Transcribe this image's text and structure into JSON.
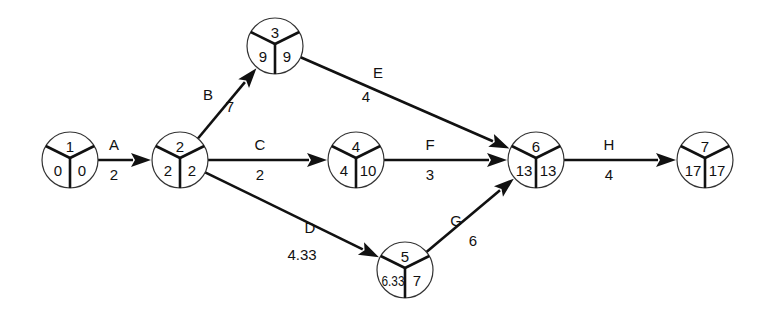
{
  "diagram": {
    "type": "activity-on-arrow network (PERT/CPM)",
    "node_radius": 28,
    "nodes": [
      {
        "id": "1",
        "x": 70,
        "y": 160,
        "label": "1",
        "earliest": "0",
        "latest": "0"
      },
      {
        "id": "2",
        "x": 180,
        "y": 160,
        "label": "2",
        "earliest": "2",
        "latest": "2"
      },
      {
        "id": "3",
        "x": 275,
        "y": 46,
        "label": "3",
        "earliest": "9",
        "latest": "9"
      },
      {
        "id": "4",
        "x": 356,
        "y": 160,
        "label": "4",
        "earliest": "4",
        "latest": "10"
      },
      {
        "id": "5",
        "x": 405,
        "y": 270,
        "label": "5",
        "earliest": "6.33",
        "latest": "7"
      },
      {
        "id": "6",
        "x": 536,
        "y": 160,
        "label": "6",
        "earliest": "13",
        "latest": "13"
      },
      {
        "id": "7",
        "x": 705,
        "y": 160,
        "label": "7",
        "earliest": "17",
        "latest": "17"
      }
    ],
    "edges": [
      {
        "activity": "A",
        "duration": "2",
        "from": "1",
        "to": "2",
        "name_pos": [
          114,
          150
        ],
        "dur_pos": [
          114,
          180
        ]
      },
      {
        "activity": "B",
        "duration": "7",
        "from": "2",
        "to": "3",
        "name_pos": [
          208,
          100
        ],
        "dur_pos": [
          230,
          112
        ]
      },
      {
        "activity": "C",
        "duration": "2",
        "from": "2",
        "to": "4",
        "name_pos": [
          260,
          150
        ],
        "dur_pos": [
          260,
          180
        ]
      },
      {
        "activity": "D",
        "duration": "4.33",
        "from": "2",
        "to": "5",
        "name_pos": [
          310,
          233
        ],
        "dur_pos": [
          302,
          260
        ]
      },
      {
        "activity": "E",
        "duration": "4",
        "from": "3",
        "to": "6",
        "name_pos": [
          378,
          78
        ],
        "dur_pos": [
          366,
          102
        ]
      },
      {
        "activity": "F",
        "duration": "3",
        "from": "4",
        "to": "6",
        "name_pos": [
          430,
          150
        ],
        "dur_pos": [
          430,
          180
        ]
      },
      {
        "activity": "G",
        "duration": "6",
        "from": "5",
        "to": "6",
        "name_pos": [
          456,
          226
        ],
        "dur_pos": [
          473,
          246
        ]
      },
      {
        "activity": "H",
        "duration": "4",
        "from": "6",
        "to": "7",
        "name_pos": [
          609,
          150
        ],
        "dur_pos": [
          609,
          180
        ]
      }
    ]
  }
}
